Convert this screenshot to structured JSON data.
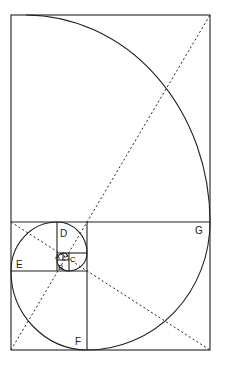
{
  "diagram": {
    "colors": {
      "line": "#222222",
      "background": "#ffffff"
    },
    "labels": {
      "A": "A",
      "one": "1",
      "B": "B",
      "C": "C",
      "D": "D",
      "E": "E",
      "F": "F",
      "G": "G"
    }
  }
}
